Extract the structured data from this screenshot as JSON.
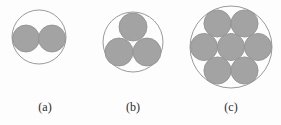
{
  "figure": {
    "background_color": "#fdfdfd",
    "circle_fill_color": "#a3a3a3",
    "circle_stroke_color": "#8f8f8f",
    "enclosing_stroke_color": "#9a9a9a",
    "label_color": "#2b2b2b",
    "panels": [
      {
        "label": "(a)",
        "label_x": 45,
        "label_y": 111,
        "count": 2,
        "enclosing": {
          "cx": 39,
          "cy": 37,
          "r": 27
        },
        "circles": [
          {
            "cx": 26,
            "cy": 38.5,
            "r": 13.5
          },
          {
            "cx": 52,
            "cy": 38.5,
            "r": 13.5
          }
        ]
      },
      {
        "label": "(b)",
        "label_x": 133,
        "label_y": 111,
        "count": 3,
        "enclosing": {
          "cx": 133,
          "cy": 42,
          "r": 30
        },
        "circles": [
          {
            "cx": 133,
            "cy": 27,
            "r": 14
          },
          {
            "cx": 119,
            "cy": 52,
            "r": 14
          },
          {
            "cx": 147,
            "cy": 52,
            "r": 14
          }
        ]
      },
      {
        "label": "(c)",
        "label_x": 231,
        "label_y": 111,
        "count": 7,
        "enclosing": {
          "cx": 231,
          "cy": 47,
          "r": 41
        },
        "circles": [
          {
            "cx": 217.5,
            "cy": 23.5,
            "r": 13.6
          },
          {
            "cx": 244.5,
            "cy": 23.5,
            "r": 13.6
          },
          {
            "cx": 204,
            "cy": 47,
            "r": 13.6
          },
          {
            "cx": 231,
            "cy": 47,
            "r": 13.6
          },
          {
            "cx": 258,
            "cy": 47,
            "r": 13.6
          },
          {
            "cx": 217.5,
            "cy": 70.5,
            "r": 13.6
          },
          {
            "cx": 244.5,
            "cy": 70.5,
            "r": 13.6
          }
        ]
      }
    ]
  }
}
